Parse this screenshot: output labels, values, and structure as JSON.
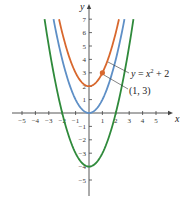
{
  "chart_data": {
    "type": "line",
    "title": "",
    "xlabel": "x",
    "ylabel": "y",
    "xlim": [
      -5.5,
      6
    ],
    "ylim": [
      -6,
      8
    ],
    "x_ticks": [
      -5,
      -4,
      -3,
      -2,
      -1,
      1,
      2,
      3,
      4,
      5
    ],
    "y_ticks": [
      -5,
      -4,
      -3,
      -2,
      -1,
      1,
      2,
      3,
      4,
      5,
      6,
      7
    ],
    "grid": false,
    "series": [
      {
        "name": "y = x^2 + 2",
        "formula": "x^2 + 2",
        "color": "#d8682e",
        "vertex": [
          0,
          2
        ]
      },
      {
        "name": "y = x^2",
        "formula": "x^2",
        "color": "#5e8fc6",
        "vertex": [
          0,
          0
        ]
      },
      {
        "name": "y = x^2 - 4",
        "formula": "x^2 - 4",
        "color": "#2f8a3b",
        "vertex": [
          0,
          -4
        ]
      }
    ],
    "highlighted_point": {
      "x": 1,
      "y": 3,
      "label": "(1, 3)",
      "color": "#d8682e"
    },
    "annotations": [
      {
        "text": "y = x² + 2",
        "target_series": "y = x^2 + 2"
      },
      {
        "text": "(1, 3)",
        "target_point": [
          1,
          3
        ]
      }
    ]
  },
  "labels": {
    "x_axis": "x",
    "y_axis": "y",
    "curve_label": "y = x² + 2",
    "point_label": "(1, 3)"
  }
}
